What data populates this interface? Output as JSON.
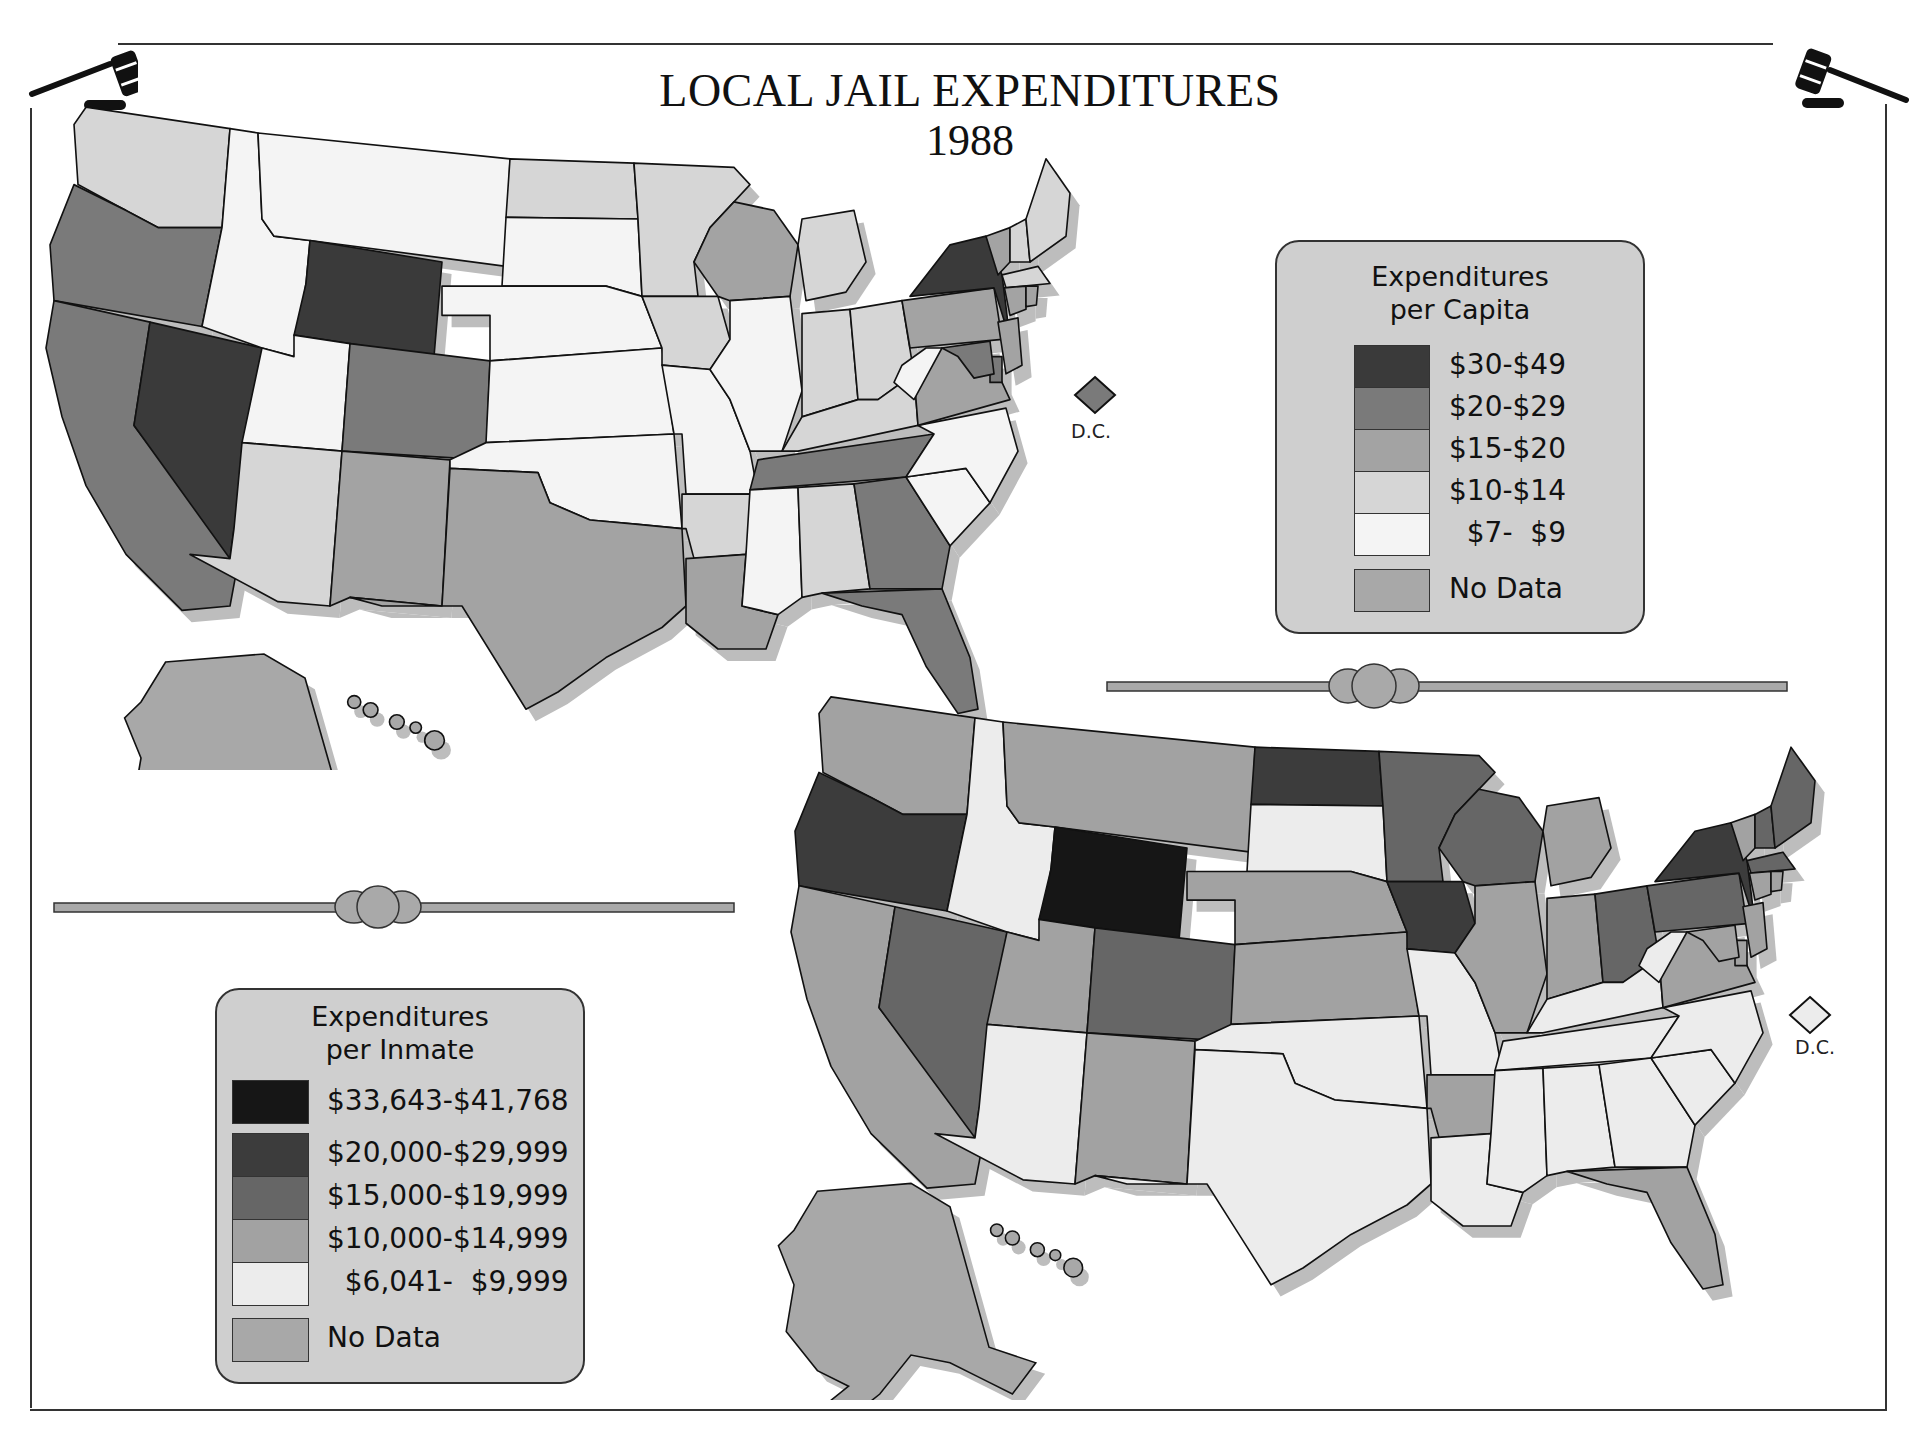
{
  "title": "LOCAL JAIL EXPENDITURES",
  "year": "1988",
  "dc_label": "D.C.",
  "colors": {
    "c1": "#3a3a3a",
    "c2": "#7a7a7a",
    "c3": "#a3a3a3",
    "c4": "#d6d6d6",
    "c5": "#f4f4f4",
    "nodata": "#a8a8a8",
    "i1": "#161616",
    "i2": "#3c3c3c",
    "i3": "#666666",
    "i4": "#a2a2a2",
    "i5": "#ececec",
    "shadow": "#bdbdbd",
    "legend_bg": "#cfcfcf"
  },
  "legend_capita": {
    "title_line1": "Expenditures",
    "title_line2": "per Capita",
    "items": [
      {
        "label": "$30-$49",
        "key": "c1"
      },
      {
        "label": "$20-$29",
        "key": "c2"
      },
      {
        "label": "$15-$20",
        "key": "c3"
      },
      {
        "label": "$10-$14",
        "key": "c4"
      },
      {
        "label": "  $7-  $9",
        "key": "c5"
      },
      {
        "label": "No Data",
        "key": "nodata"
      }
    ]
  },
  "legend_inmate": {
    "title_line1": "Expenditures",
    "title_line2": "per Inmate",
    "items": [
      {
        "label": "$33,643-$41,768",
        "key": "i1"
      },
      {
        "label": "$20,000-$29,999",
        "key": "i2"
      },
      {
        "label": "$15,000-$19,999",
        "key": "i3"
      },
      {
        "label": "$10,000-$14,999",
        "key": "i4"
      },
      {
        "label": "  $6,041-  $9,999",
        "key": "i5"
      },
      {
        "label": "No Data",
        "key": "nodata"
      }
    ]
  },
  "chart_data": [
    {
      "type": "choropleth",
      "title": "LOCAL JAIL EXPENDITURES 1988",
      "subtitle": "Expenditures per Capita",
      "classes": [
        "$30-$49",
        "$20-$29",
        "$15-$20",
        "$10-$14",
        "$7- $9",
        "No Data"
      ],
      "values": {
        "WA": "$10-$14",
        "OR": "$20-$29",
        "CA": "$20-$29",
        "NV": "$30-$49",
        "ID": "$7- $9",
        "MT": "$7- $9",
        "WY": "$30-$49",
        "UT": "$7- $9",
        "CO": "$20-$29",
        "AZ": "$10-$14",
        "NM": "$15-$20",
        "ND": "$10-$14",
        "SD": "$7- $9",
        "NE": "$7- $9",
        "KS": "$7- $9",
        "OK": "$7- $9",
        "TX": "$15-$20",
        "MN": "$10-$14",
        "IA": "$10-$14",
        "MO": "$7- $9",
        "AR": "$10-$14",
        "LA": "$15-$20",
        "WI": "$15-$20",
        "IL": "$7- $9",
        "MI": "$10-$14",
        "IN": "$10-$14",
        "OH": "$10-$14",
        "KY": "$10-$14",
        "TN": "$20-$29",
        "MS": "$7- $9",
        "AL": "$10-$14",
        "GA": "$20-$29",
        "FL": "$20-$29",
        "SC": "$7- $9",
        "NC": "$7- $9",
        "VA": "$15-$20",
        "WV": "$7- $9",
        "PA": "$15-$20",
        "NY": "$30-$49",
        "VT": "$15-$20",
        "NH": "$10-$14",
        "ME": "$10-$14",
        "MA": "$10-$14",
        "CT": "$15-$20",
        "RI": "$15-$20",
        "NJ": "$15-$20",
        "DE": "$20-$29",
        "MD": "$20-$29",
        "DC": "$20-$29",
        "AK": "No Data",
        "HI": "No Data"
      }
    },
    {
      "type": "choropleth",
      "subtitle": "Expenditures per Inmate",
      "classes": [
        "$33,643-$41,768",
        "$20,000-$29,999",
        "$15,000-$19,999",
        "$10,000-$14,999",
        "$6,041- $9,999",
        "No Data"
      ],
      "values": {
        "WA": "$10,000-$14,999",
        "OR": "$20,000-$29,999",
        "CA": "$10,000-$14,999",
        "NV": "$15,000-$19,999",
        "ID": "$6,041- $9,999",
        "MT": "$10,000-$14,999",
        "WY": "$33,643-$41,768",
        "UT": "$10,000-$14,999",
        "CO": "$15,000-$19,999",
        "AZ": "$6,041- $9,999",
        "NM": "$10,000-$14,999",
        "ND": "$20,000-$29,999",
        "SD": "$6,041- $9,999",
        "NE": "$10,000-$14,999",
        "KS": "$10,000-$14,999",
        "OK": "$6,041- $9,999",
        "TX": "$6,041- $9,999",
        "MN": "$15,000-$19,999",
        "IA": "$20,000-$29,999",
        "MO": "$6,041- $9,999",
        "AR": "$10,000-$14,999",
        "LA": "$6,041- $9,999",
        "WI": "$15,000-$19,999",
        "IL": "$10,000-$14,999",
        "MI": "$10,000-$14,999",
        "IN": "$10,000-$14,999",
        "OH": "$15,000-$19,999",
        "KY": "$6,041- $9,999",
        "TN": "$6,041- $9,999",
        "MS": "$6,041- $9,999",
        "AL": "$6,041- $9,999",
        "GA": "$6,041- $9,999",
        "FL": "$10,000-$14,999",
        "SC": "$6,041- $9,999",
        "NC": "$6,041- $9,999",
        "VA": "$10,000-$14,999",
        "WV": "$6,041- $9,999",
        "PA": "$15,000-$19,999",
        "NY": "$20,000-$29,999",
        "VT": "$10,000-$14,999",
        "NH": "$15,000-$19,999",
        "ME": "$15,000-$19,999",
        "MA": "$15,000-$19,999",
        "CT": "$10,000-$14,999",
        "RI": "$10,000-$14,999",
        "NJ": "$10,000-$14,999",
        "DE": "$10,000-$14,999",
        "MD": "$10,000-$14,999",
        "DC": "$6,041- $9,999",
        "AK": "No Data",
        "HI": "No Data"
      }
    }
  ],
  "map_top_fill": {
    "WA": "c4",
    "OR": "c2",
    "CA": "c2",
    "NV": "c1",
    "ID": "c5",
    "MT": "c5",
    "WY": "c1",
    "UT": "c5",
    "CO": "c2",
    "AZ": "c4",
    "NM": "c3",
    "ND": "c4",
    "SD": "c5",
    "NE": "c5",
    "KS": "c5",
    "OK": "c5",
    "TX": "c3",
    "MN": "c4",
    "IA": "c4",
    "MO": "c5",
    "AR": "c4",
    "LA": "c3",
    "WI": "c3",
    "IL": "c5",
    "MI": "c4",
    "IN": "c4",
    "OH": "c4",
    "KY": "c4",
    "TN": "c2",
    "MS": "c5",
    "AL": "c4",
    "GA": "c2",
    "FL": "c2",
    "SC": "c5",
    "NC": "c5",
    "VA": "c3",
    "WV": "c5",
    "PA": "c3",
    "NY": "c1",
    "VT": "c3",
    "NH": "c4",
    "ME": "c4",
    "MA": "c4",
    "CT": "c3",
    "RI": "c3",
    "NJ": "c3",
    "DE": "c2",
    "MD": "c2",
    "DC": "c2",
    "AK": "nodata",
    "HI": "nodata"
  },
  "map_bottom_fill": {
    "WA": "i4",
    "OR": "i2",
    "CA": "i4",
    "NV": "i3",
    "ID": "i5",
    "MT": "i4",
    "WY": "i1",
    "UT": "i4",
    "CO": "i3",
    "AZ": "i5",
    "NM": "i4",
    "ND": "i2",
    "SD": "i5",
    "NE": "i4",
    "KS": "i4",
    "OK": "i5",
    "TX": "i5",
    "MN": "i3",
    "IA": "i2",
    "MO": "i5",
    "AR": "i4",
    "LA": "i5",
    "WI": "i3",
    "IL": "i4",
    "MI": "i4",
    "IN": "i4",
    "OH": "i3",
    "KY": "i5",
    "TN": "i5",
    "MS": "i5",
    "AL": "i5",
    "GA": "i5",
    "FL": "i4",
    "SC": "i5",
    "NC": "i5",
    "VA": "i4",
    "WV": "i5",
    "PA": "i3",
    "NY": "i2",
    "VT": "i4",
    "NH": "i3",
    "ME": "i3",
    "MA": "i3",
    "CT": "i4",
    "RI": "i4",
    "NJ": "i4",
    "DE": "i4",
    "MD": "i4",
    "DC": "i5",
    "AK": "nodata",
    "HI": "nodata"
  }
}
